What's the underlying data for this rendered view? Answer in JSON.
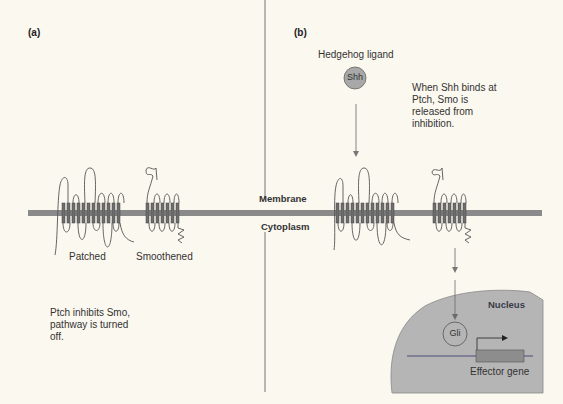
{
  "panels": {
    "a": {
      "label": "(a)",
      "proteins": {
        "patched": "Patched",
        "smoothened": "Smoothened"
      },
      "caption": [
        "Ptch inhibits Smo,",
        "pathway is turned",
        "off."
      ]
    },
    "b": {
      "label": "(b)",
      "ligand_title": "Hedgehog ligand",
      "ligand_name": "Shh",
      "caption": [
        "When Shh binds at",
        "Ptch, Smo is",
        "released from",
        "inhibition."
      ],
      "nucleus": {
        "label": "Nucleus",
        "transcription_factor": "Gli",
        "gene_label": "Effector gene"
      }
    }
  },
  "compartments": {
    "membrane": "Membrane",
    "cytoplasm": "Cytoplasm"
  },
  "colors": {
    "background": "#fbf8ef",
    "membrane": "#8a8a8a",
    "protein_band": "#6e6e6e",
    "protein_line": "#555555",
    "ligand_fill": "#a8a8a8",
    "nucleus_fill": "#b5b5b5",
    "gene_box": "#8d8d8d",
    "dna_line": "#4a4a7a",
    "arrow": "#777777"
  }
}
